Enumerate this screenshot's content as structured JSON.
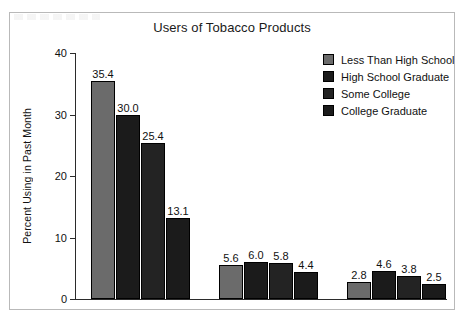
{
  "chart_data": {
    "type": "bar",
    "title": "Users of Tobacco Products",
    "xlabel": "",
    "ylabel": "Percent Using in Past Month",
    "ylim": [
      0,
      40
    ],
    "yticks": [
      0,
      10,
      20,
      30,
      40
    ],
    "ytick_labels": [
      "0",
      "10",
      "20",
      "30",
      "40"
    ],
    "grid": false,
    "legend_position": "top-right",
    "categories": [
      "Group 1",
      "Group 2",
      "Group 3"
    ],
    "series": [
      {
        "name": "Less Than High School",
        "color": "#6b6b6b",
        "values": [
          35.4,
          5.6,
          2.8
        ],
        "labels": [
          "35.4",
          "5.6",
          "2.8"
        ]
      },
      {
        "name": "High School Graduate",
        "color": "#1b1b1b",
        "values": [
          30.0,
          6.0,
          4.6
        ],
        "labels": [
          "30.0",
          "6.0",
          "4.6"
        ]
      },
      {
        "name": "Some College",
        "color": "#232323",
        "values": [
          25.4,
          5.8,
          3.8
        ],
        "labels": [
          "25.4",
          "5.8",
          "3.8"
        ]
      },
      {
        "name": "College Graduate",
        "color": "#1b1b1b",
        "values": [
          13.1,
          4.4,
          2.5
        ],
        "labels": [
          "13.1",
          "4.4",
          "2.5"
        ]
      }
    ]
  },
  "legend": {
    "items": [
      {
        "label": "Less Than High School",
        "color": "#6b6b6b"
      },
      {
        "label": "High School Graduate",
        "color": "#1b1b1b"
      },
      {
        "label": "Some College",
        "color": "#232323"
      },
      {
        "label": "College Graduate",
        "color": "#1b1b1b"
      }
    ]
  },
  "axis": {
    "ticks": [
      {
        "label": "40",
        "value": 40
      },
      {
        "label": "30",
        "value": 30
      },
      {
        "label": "20",
        "value": 20
      },
      {
        "label": "10",
        "value": 10
      },
      {
        "label": "0",
        "value": 0
      }
    ]
  }
}
